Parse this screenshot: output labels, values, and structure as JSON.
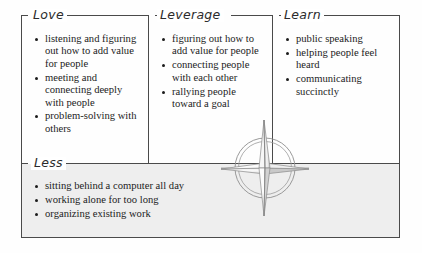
{
  "diagram": {
    "title_visible": false,
    "type": "four-quadrant skills matrix with compass rose",
    "border_color": "#4a4a4a",
    "shaded_panel_color": "#eeeeee",
    "sections": [
      {
        "key": "love",
        "label": "Love",
        "items": [
          "listening and figuring out how to add value for people",
          "meeting and connecting deeply with people",
          "problem-solving with others"
        ]
      },
      {
        "key": "leverage",
        "label": "Leverage",
        "items": [
          "figuring out how to add value for people",
          "connecting people with each other",
          "rallying people toward a goal"
        ]
      },
      {
        "key": "learn",
        "label": "Learn",
        "items": [
          "public speaking",
          "helping people feel heard",
          "communicating succinctly"
        ]
      },
      {
        "key": "less",
        "label": "Less",
        "items": [
          "sitting behind a computer all day",
          "working alone for too long",
          "organizing existing work"
        ]
      }
    ],
    "decoration": {
      "name": "compass-rose",
      "description": "four-pointed star with two concentric circles, pencil sketch style"
    }
  }
}
